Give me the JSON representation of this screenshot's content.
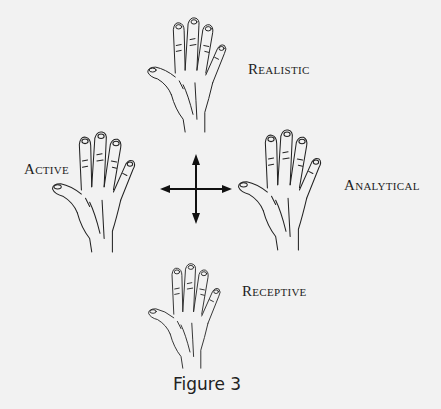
{
  "figure": {
    "caption": "Figure 3",
    "labels": {
      "top": "Realistic",
      "left": "Active",
      "right": "Analytical",
      "bottom": "Receptive"
    },
    "center_symbol": "four-way-arrow-icon",
    "colors": {
      "background": "#f2f2f2",
      "ink": "#1a1a1a"
    }
  }
}
